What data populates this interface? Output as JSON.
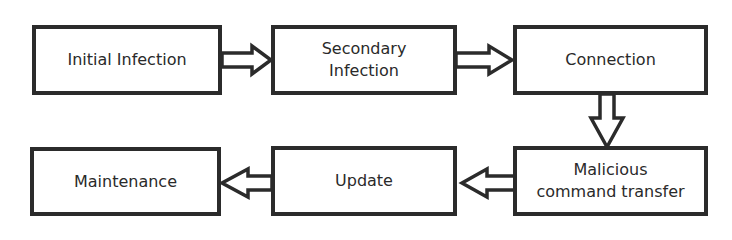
{
  "diagram": {
    "type": "flowchart",
    "colors": {
      "stroke": "#2b2b2b",
      "fill": "#ffffff",
      "text": "#2a2a2a"
    },
    "nodes": [
      {
        "id": "initial-infection",
        "label": "Initial Infection"
      },
      {
        "id": "secondary-infection",
        "label": "Secondary\nInfection"
      },
      {
        "id": "connection",
        "label": "Connection"
      },
      {
        "id": "malicious-command-transfer",
        "label": "Malicious\ncommand transfer"
      },
      {
        "id": "update",
        "label": "Update"
      },
      {
        "id": "maintenance",
        "label": "Maintenance"
      }
    ],
    "edges": [
      {
        "from": "initial-infection",
        "to": "secondary-infection"
      },
      {
        "from": "secondary-infection",
        "to": "connection"
      },
      {
        "from": "connection",
        "to": "malicious-command-transfer"
      },
      {
        "from": "malicious-command-transfer",
        "to": "update"
      },
      {
        "from": "update",
        "to": "maintenance"
      }
    ]
  }
}
